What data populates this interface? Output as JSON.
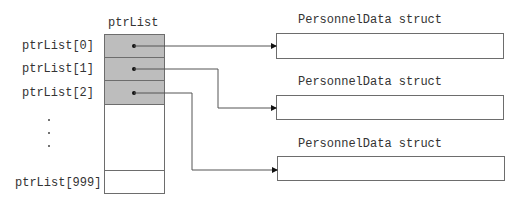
{
  "diagram": {
    "array_title": "ptrList",
    "index_labels": [
      "ptrList[0]",
      "ptrList[1]",
      "ptrList[2]",
      "ptrList[999]"
    ],
    "ellipsis": ".",
    "struct_labels": [
      "PersonnelData struct",
      "PersonnelData struct",
      "PersonnelData struct"
    ],
    "colors": {
      "filled_cell": "#bdbdbd",
      "border": "#6d6d6d",
      "line": "#555555"
    }
  }
}
